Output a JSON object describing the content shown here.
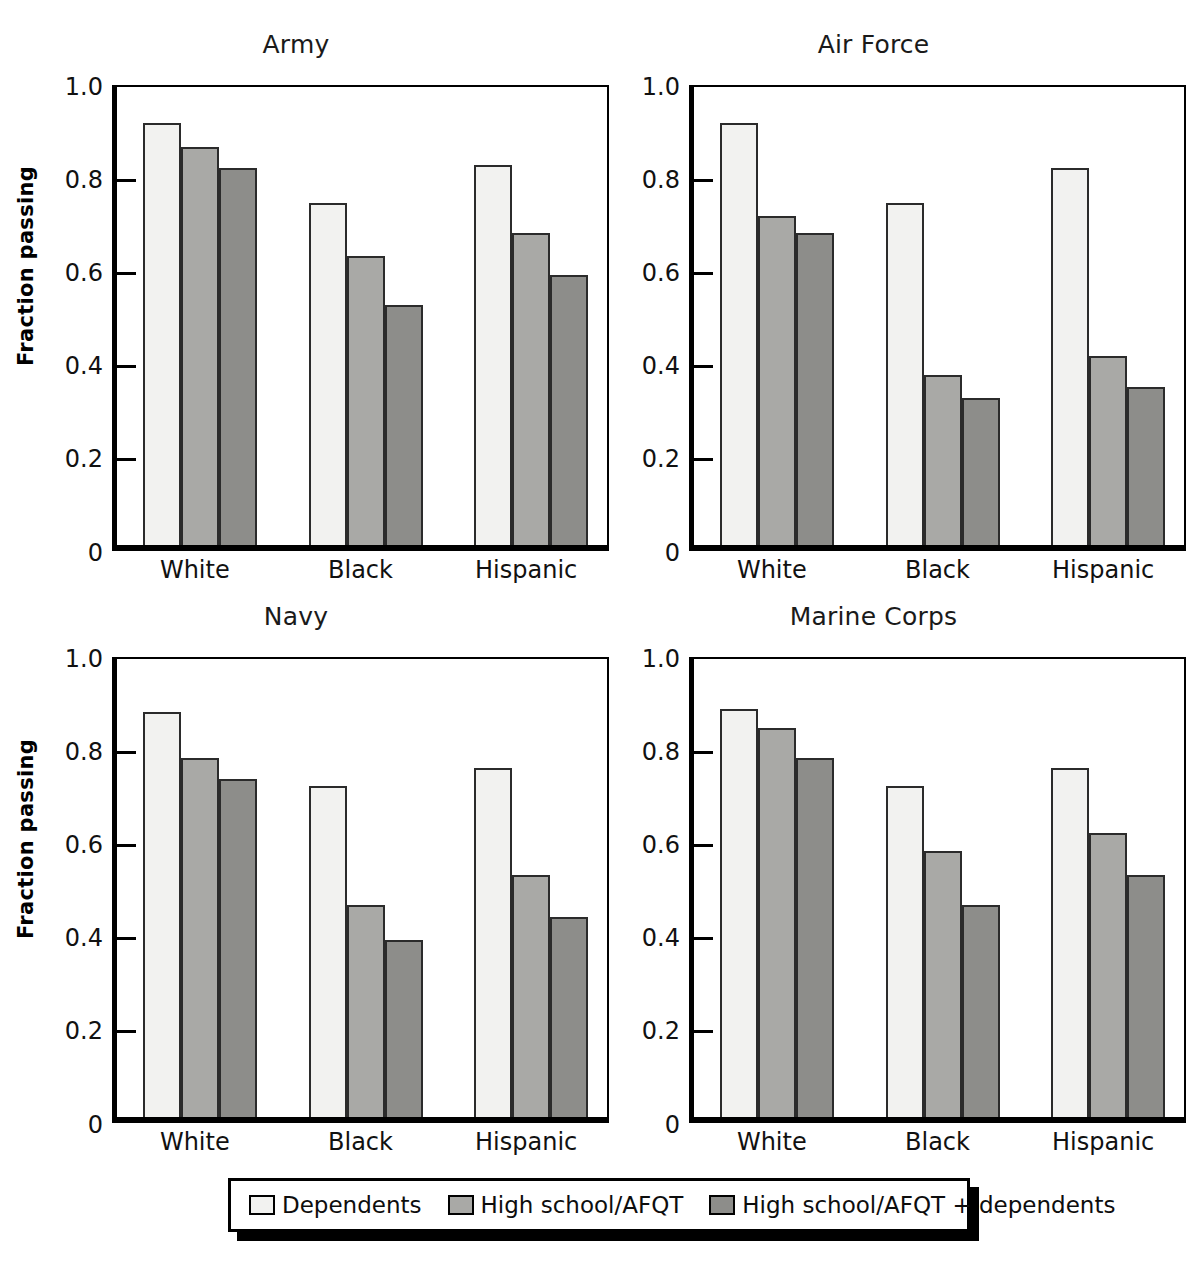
{
  "chart_data": {
    "type": "bar",
    "title": "",
    "layout": "2x2 small multiples",
    "panels": [
      {
        "title": "Army",
        "categories": [
          "White",
          "Black",
          "Hispanic"
        ],
        "series": [
          {
            "name": "Dependents",
            "values": [
              0.905,
              0.735,
              0.815
            ]
          },
          {
            "name": "High school/AFQT",
            "values": [
              0.855,
              0.62,
              0.67
            ]
          },
          {
            "name": "High school/AFQT + dependents",
            "values": [
              0.81,
              0.515,
              0.58
            ]
          }
        ]
      },
      {
        "title": "Air Force",
        "categories": [
          "White",
          "Black",
          "Hispanic"
        ],
        "series": [
          {
            "name": "Dependents",
            "values": [
              0.905,
              0.735,
              0.81
            ]
          },
          {
            "name": "High school/AFQT",
            "values": [
              0.705,
              0.365,
              0.405
            ]
          },
          {
            "name": "High school/AFQT + dependents",
            "values": [
              0.67,
              0.315,
              0.34
            ]
          }
        ]
      },
      {
        "title": "Navy",
        "categories": [
          "White",
          "Black",
          "Hispanic"
        ],
        "series": [
          {
            "name": "Dependents",
            "values": [
              0.87,
              0.71,
              0.75
            ]
          },
          {
            "name": "High school/AFQT",
            "values": [
              0.77,
              0.455,
              0.52
            ]
          },
          {
            "name": "High school/AFQT + dependents",
            "values": [
              0.725,
              0.38,
              0.43
            ]
          }
        ]
      },
      {
        "title": "Marine Corps",
        "categories": [
          "White",
          "Black",
          "Hispanic"
        ],
        "series": [
          {
            "name": "Dependents",
            "values": [
              0.875,
              0.71,
              0.75
            ]
          },
          {
            "name": "High school/AFQT",
            "values": [
              0.835,
              0.57,
              0.61
            ]
          },
          {
            "name": "High school/AFQT + dependents",
            "values": [
              0.77,
              0.455,
              0.52
            ]
          }
        ]
      }
    ],
    "ylabel": "Fraction passing",
    "xlabel": "",
    "ylim": [
      0,
      1.0
    ],
    "yticks": [
      0,
      0.2,
      0.4,
      0.6,
      0.8,
      1.0
    ],
    "ytick_labels": [
      "0",
      "0.2",
      "0.4",
      "0.6",
      "0.8",
      "1.0"
    ],
    "grid": false,
    "legend_position": "bottom",
    "legend": [
      {
        "label": "Dependents",
        "color": "#f2f2f0"
      },
      {
        "label": "High school/AFQT",
        "color": "#a9a9a6"
      },
      {
        "label": "High school/AFQT + dependents",
        "color": "#8d8d8a"
      }
    ]
  },
  "colors": {
    "series_0": "#f2f2f0",
    "series_1": "#a9a9a6",
    "series_2": "#8d8d8a",
    "axis": "#000000",
    "background": "#ffffff"
  }
}
